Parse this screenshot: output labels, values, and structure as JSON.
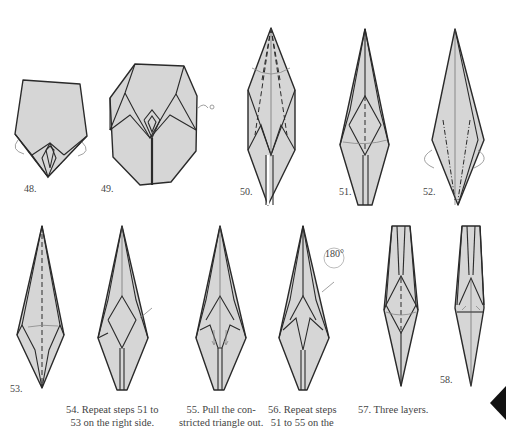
{
  "page": {
    "type": "origami-instructions",
    "colors": {
      "paper": "#d6d6d6",
      "line": "#2a2a2a",
      "arrow": "#777777",
      "background": "#ffffff",
      "tab": "#111111"
    }
  },
  "steps": [
    {
      "num": "48.",
      "caption": ""
    },
    {
      "num": "49.",
      "caption": ""
    },
    {
      "num": "50.",
      "caption": ""
    },
    {
      "num": "51.",
      "caption": ""
    },
    {
      "num": "52.",
      "caption": ""
    },
    {
      "num": "53.",
      "caption": ""
    },
    {
      "num": "54.",
      "caption_line1": "54. Repeat steps 51 to",
      "caption_line2": "53 on the right side."
    },
    {
      "num": "55.",
      "caption_line1": "55. Pull the con-",
      "caption_line2": "stricted triangle out."
    },
    {
      "num": "56.",
      "caption_line1": "56. Repeat steps",
      "caption_line2": "51 to 55 on the",
      "rotation_label": "180°"
    },
    {
      "num": "57.",
      "caption_line1": "57. Three layers."
    },
    {
      "num": "58.",
      "caption": ""
    }
  ]
}
